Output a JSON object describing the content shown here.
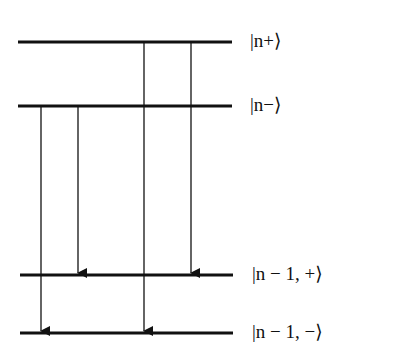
{
  "diagram": {
    "title": "",
    "colors": {
      "line": "#111111",
      "background": "#ffffff"
    },
    "levels": [
      {
        "id": "n_plus",
        "label": "|n+⟩",
        "y": 42,
        "x1": 18,
        "x2": 232
      },
      {
        "id": "n_minus",
        "label": "|n−⟩",
        "y": 106,
        "x1": 18,
        "x2": 232
      },
      {
        "id": "n_minus1_plus",
        "label": "|n − 1, +⟩",
        "y": 275,
        "x1": 20,
        "x2": 233
      },
      {
        "id": "n_minus1_minus",
        "label": "|n − 1, −⟩",
        "y": 333,
        "x1": 20,
        "x2": 233
      }
    ],
    "transitions": [
      {
        "from": "n_minus",
        "to": "n_minus1_minus",
        "x": 41
      },
      {
        "from": "n_minus",
        "to": "n_minus1_plus",
        "x": 78
      },
      {
        "from": "n_plus",
        "to": "n_minus1_minus",
        "x": 144
      },
      {
        "from": "n_plus",
        "to": "n_minus1_plus",
        "x": 191
      }
    ]
  }
}
